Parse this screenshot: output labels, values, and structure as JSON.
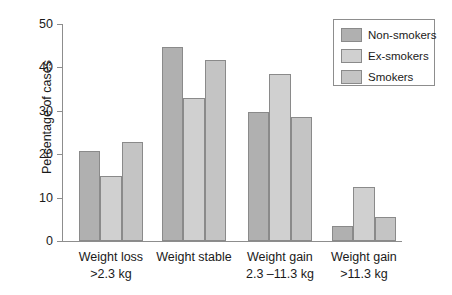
{
  "chart_data": {
    "type": "bar",
    "title": "",
    "xlabel": "",
    "ylabel": "Percentage of cases",
    "ylim": [
      0,
      50
    ],
    "yticks": [
      0,
      10,
      20,
      30,
      40,
      50
    ],
    "grid": false,
    "legend_position": "top-right",
    "categories": [
      {
        "line1": "Weight loss",
        "line2": ">2.3 kg"
      },
      {
        "line1": "Weight stable",
        "line2": ""
      },
      {
        "line1": "Weight gain",
        "line2": "2.3 –11.3 kg"
      },
      {
        "line1": "Weight gain",
        "line2": ">11.3 kg"
      }
    ],
    "series": [
      {
        "name": "Non-smokers",
        "color": "#b0b0b0",
        "values": [
          20.8,
          44.6,
          29.7,
          3.5
        ]
      },
      {
        "name": "Ex-smokers",
        "color": "#d0d0d0",
        "values": [
          15.0,
          33.0,
          38.4,
          12.5
        ]
      },
      {
        "name": "Smokers",
        "color": "#c4c4c4",
        "values": [
          22.9,
          41.7,
          28.6,
          5.5
        ]
      }
    ]
  },
  "legend": {
    "items": [
      {
        "label": "Non-smokers",
        "color": "#b0b0b0"
      },
      {
        "label": "Ex-smokers",
        "color": "#d0d0d0"
      },
      {
        "label": "Smokers",
        "color": "#c4c4c4"
      }
    ]
  }
}
